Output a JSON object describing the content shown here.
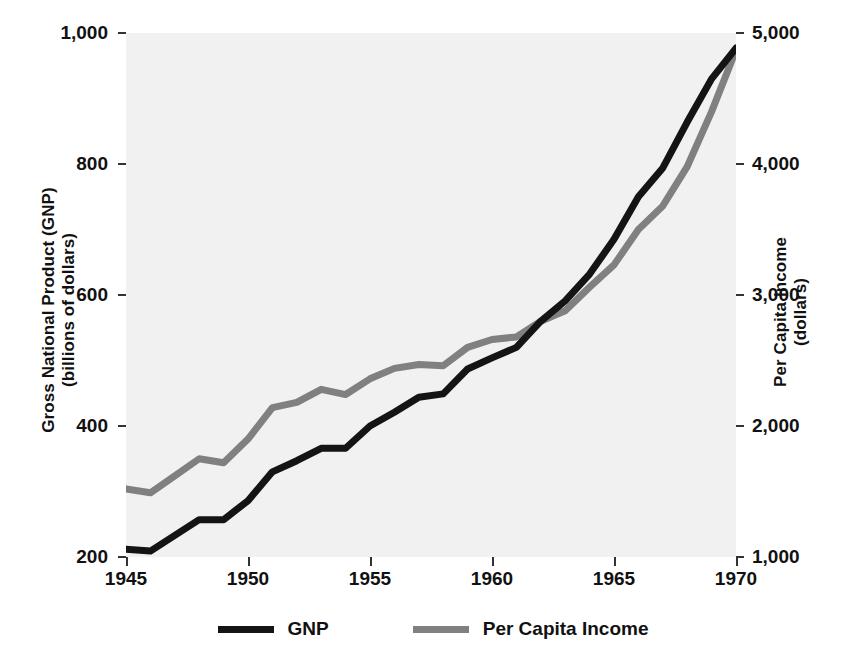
{
  "chart_data": {
    "type": "line",
    "title": "",
    "xlabel": "",
    "grid": false,
    "legend_position": "bottom-center",
    "x": [
      1945,
      1946,
      1947,
      1948,
      1949,
      1950,
      1951,
      1952,
      1953,
      1954,
      1955,
      1956,
      1957,
      1958,
      1959,
      1960,
      1961,
      1962,
      1963,
      1964,
      1965,
      1966,
      1967,
      1968,
      1969,
      1970
    ],
    "xlim": [
      1945,
      1970
    ],
    "xticks": [
      "1945",
      "1950",
      "1955",
      "1960",
      "1965",
      "1970"
    ],
    "xtick_values": [
      1945,
      1950,
      1955,
      1960,
      1965,
      1970
    ],
    "axes": [
      {
        "id": "left",
        "label_line1": "Gross National Product (GNP)",
        "label_line2": "(billions of dollars)",
        "ticks": [
          "1,000",
          "800",
          "600",
          "400",
          "200"
        ],
        "tick_values": [
          1000,
          800,
          600,
          400,
          200
        ],
        "ylim": [
          200,
          1000
        ]
      },
      {
        "id": "right",
        "label_line1": "Per Capita Income",
        "label_line2": "(dollars)",
        "ticks": [
          "5,000",
          "4,000",
          "3,000",
          "2,000",
          "1,000"
        ],
        "tick_values": [
          5000,
          4000,
          3000,
          2000,
          1000
        ],
        "ylim": [
          1000,
          5000
        ]
      }
    ],
    "series": [
      {
        "name": "GNP",
        "axis": "left",
        "color": "#141414",
        "values": [
          212,
          209,
          233,
          257,
          257,
          286,
          330,
          347,
          366,
          366,
          400,
          421,
          444,
          449,
          487,
          504,
          520,
          560,
          591,
          632,
          685,
          750,
          794,
          864,
          930,
          977
        ]
      },
      {
        "name": "Per Capita Income",
        "axis": "right",
        "color": "#808080",
        "values": [
          1520,
          1490,
          1620,
          1750,
          1720,
          1900,
          2140,
          2180,
          2280,
          2240,
          2360,
          2440,
          2470,
          2460,
          2600,
          2660,
          2680,
          2800,
          2880,
          3060,
          3230,
          3500,
          3680,
          3980,
          4400,
          4870
        ]
      }
    ]
  },
  "legend": {
    "items": [
      {
        "label": "GNP",
        "color": "#141414"
      },
      {
        "label": "Per Capita Income",
        "color": "#808080"
      }
    ]
  }
}
